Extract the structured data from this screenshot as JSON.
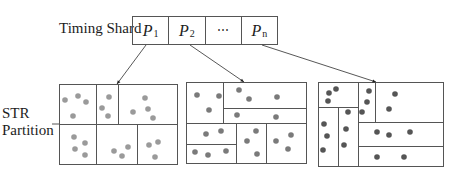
{
  "labels": {
    "timing_shard": "Timing Shard",
    "str_line1": "STR",
    "str_line2": "Partition"
  },
  "shards": [
    {
      "name": "P",
      "sub": "1"
    },
    {
      "name": "P",
      "sub": "2"
    },
    {
      "name": "⋯",
      "sub": ""
    },
    {
      "name": "P",
      "sub": "n"
    }
  ],
  "colors": {
    "stroke": "#555555",
    "dot_p1": "#9a9a9a",
    "dot_p2": "#7a7a7a",
    "dot_pn": "#555555"
  },
  "partitions": [
    {
      "name": "P1 partition",
      "dot_color": "#9a9a9a",
      "box": [
        59,
        84,
        177,
        164
      ],
      "lines": [
        [
          59,
          124,
          96,
          124
        ],
        [
          96,
          84,
          96,
          124
        ],
        [
          96,
          124,
          96,
          164
        ],
        [
          96,
          124,
          177,
          124
        ],
        [
          118,
          84,
          118,
          124
        ],
        [
          96,
          124,
          96,
          164
        ],
        [
          137,
          124,
          137,
          164
        ]
      ],
      "dots": [
        [
          65,
          100
        ],
        [
          78,
          96
        ],
        [
          86,
          102
        ],
        [
          73,
          116
        ],
        [
          74,
          137
        ],
        [
          85,
          143
        ],
        [
          75,
          149
        ],
        [
          85,
          155
        ],
        [
          109,
          97
        ],
        [
          102,
          108
        ],
        [
          108,
          116
        ],
        [
          145,
          98
        ],
        [
          133,
          112
        ],
        [
          148,
          109
        ],
        [
          153,
          118
        ],
        [
          114,
          151
        ],
        [
          122,
          156
        ],
        [
          128,
          147
        ],
        [
          149,
          145
        ],
        [
          158,
          142
        ],
        [
          155,
          157
        ]
      ]
    },
    {
      "name": "P2 partition",
      "dot_color": "#7a7a7a",
      "box": [
        186,
        82,
        306,
        163
      ],
      "lines": [
        [
          186,
          123,
          306,
          123
        ],
        [
          223,
          82,
          223,
          123
        ],
        [
          223,
          108,
          306,
          108
        ],
        [
          186,
          144,
          236,
          144
        ],
        [
          236,
          123,
          236,
          163
        ],
        [
          266,
          123,
          266,
          163
        ]
      ],
      "dots": [
        [
          197,
          95
        ],
        [
          219,
          96
        ],
        [
          209,
          110
        ],
        [
          239,
          90
        ],
        [
          249,
          99
        ],
        [
          277,
          97
        ],
        [
          237,
          115
        ],
        [
          276,
          117
        ],
        [
          206,
          134
        ],
        [
          221,
          131
        ],
        [
          195,
          152
        ],
        [
          208,
          155
        ],
        [
          226,
          151
        ],
        [
          256,
          131
        ],
        [
          247,
          141
        ],
        [
          257,
          154
        ],
        [
          276,
          141
        ],
        [
          291,
          135
        ],
        [
          288,
          149
        ]
      ]
    },
    {
      "name": "Pn partition",
      "dot_color": "#555555",
      "box": [
        318,
        82,
        443,
        166
      ],
      "lines": [
        [
          318,
          107,
          358,
          107
        ],
        [
          358,
          82,
          358,
          166
        ],
        [
          338,
          107,
          338,
          166
        ],
        [
          375,
          82,
          375,
          122
        ],
        [
          358,
          122,
          443,
          122
        ],
        [
          358,
          146,
          443,
          146
        ]
      ],
      "dots": [
        [
          329,
          93
        ],
        [
          336,
          89
        ],
        [
          328,
          101
        ],
        [
          348,
          112
        ],
        [
          324,
          124
        ],
        [
          327,
          136
        ],
        [
          323,
          150
        ],
        [
          346,
          129
        ],
        [
          344,
          145
        ],
        [
          369,
          91
        ],
        [
          367,
          102
        ],
        [
          362,
          112
        ],
        [
          395,
          94
        ],
        [
          389,
          109
        ],
        [
          377,
          132
        ],
        [
          389,
          135
        ],
        [
          410,
          132
        ],
        [
          377,
          157
        ],
        [
          404,
          157
        ]
      ]
    }
  ],
  "arrows": [
    {
      "from": [
        146,
        45
      ],
      "to": [
        117,
        84
      ]
    },
    {
      "from": [
        190,
        45
      ],
      "to": [
        244,
        82
      ]
    },
    {
      "from": [
        262,
        45
      ],
      "to": [
        376,
        82
      ]
    }
  ]
}
